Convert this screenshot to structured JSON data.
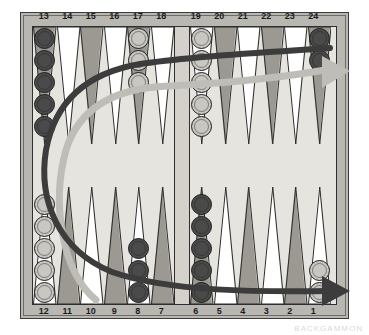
{
  "board": {
    "title": "Backgammon board diagram",
    "point_numbers_top": [
      "13",
      "14",
      "15",
      "16",
      "17",
      "18",
      "19",
      "20",
      "21",
      "22",
      "23",
      "24"
    ],
    "point_numbers_bottom": [
      "12",
      "11",
      "10",
      "9",
      "8",
      "7",
      "6",
      "5",
      "4",
      "3",
      "2",
      "1"
    ],
    "colors": {
      "frame": "#b9b7b1",
      "surface": "#e6e4de",
      "point_dark": "#9b9992",
      "point_light": "#ffffff",
      "checker_dark": "#4a4a4a",
      "checker_light": "#c9c7c1",
      "arrow_dark": "#3c3c3c",
      "arrow_light": "#bfbdb7",
      "outline": "#1d1d1d"
    },
    "points": [
      {
        "number": "13",
        "quadrant": "top-left",
        "index": 0,
        "color": "dark",
        "count": 5
      },
      {
        "number": "14",
        "quadrant": "top-left",
        "index": 1,
        "color": "none",
        "count": 0
      },
      {
        "number": "15",
        "quadrant": "top-left",
        "index": 2,
        "color": "none",
        "count": 0
      },
      {
        "number": "16",
        "quadrant": "top-left",
        "index": 3,
        "color": "none",
        "count": 0
      },
      {
        "number": "17",
        "quadrant": "top-left",
        "index": 4,
        "color": "light",
        "count": 3
      },
      {
        "number": "18",
        "quadrant": "top-left",
        "index": 5,
        "color": "none",
        "count": 0
      },
      {
        "number": "19",
        "quadrant": "top-right",
        "index": 0,
        "color": "light",
        "count": 5
      },
      {
        "number": "20",
        "quadrant": "top-right",
        "index": 1,
        "color": "none",
        "count": 0
      },
      {
        "number": "21",
        "quadrant": "top-right",
        "index": 2,
        "color": "none",
        "count": 0
      },
      {
        "number": "22",
        "quadrant": "top-right",
        "index": 3,
        "color": "none",
        "count": 0
      },
      {
        "number": "23",
        "quadrant": "top-right",
        "index": 4,
        "color": "none",
        "count": 0
      },
      {
        "number": "24",
        "quadrant": "top-right",
        "index": 5,
        "color": "dark",
        "count": 2
      },
      {
        "number": "12",
        "quadrant": "bottom-left",
        "index": 0,
        "color": "light",
        "count": 5
      },
      {
        "number": "11",
        "quadrant": "bottom-left",
        "index": 1,
        "color": "none",
        "count": 0
      },
      {
        "number": "10",
        "quadrant": "bottom-left",
        "index": 2,
        "color": "none",
        "count": 0
      },
      {
        "number": "9",
        "quadrant": "bottom-left",
        "index": 3,
        "color": "none",
        "count": 0
      },
      {
        "number": "8",
        "quadrant": "bottom-left",
        "index": 4,
        "color": "dark",
        "count": 3
      },
      {
        "number": "7",
        "quadrant": "bottom-left",
        "index": 5,
        "color": "none",
        "count": 0
      },
      {
        "number": "6",
        "quadrant": "bottom-right",
        "index": 0,
        "color": "dark",
        "count": 5
      },
      {
        "number": "5",
        "quadrant": "bottom-right",
        "index": 1,
        "color": "none",
        "count": 0
      },
      {
        "number": "4",
        "quadrant": "bottom-right",
        "index": 2,
        "color": "none",
        "count": 0
      },
      {
        "number": "3",
        "quadrant": "bottom-right",
        "index": 3,
        "color": "none",
        "count": 0
      },
      {
        "number": "2",
        "quadrant": "bottom-right",
        "index": 4,
        "color": "none",
        "count": 0
      },
      {
        "number": "1",
        "quadrant": "bottom-right",
        "index": 5,
        "color": "light",
        "count": 2
      }
    ],
    "arrows": [
      {
        "name": "dark-player-direction",
        "color": "#3c3c3c",
        "description": "Dark checkers travel from point 24 anticlockwise around the left side to point 1",
        "from_point": "24",
        "to_point": "1"
      },
      {
        "name": "light-player-direction",
        "color": "#bfbdb7",
        "description": "Light checkers travel from point 1 clockwise around the left side to point 24",
        "from_point": "1",
        "to_point": "24"
      }
    ],
    "ghost_text": [
      {
        "text": "backgammon movement",
        "x": 120,
        "y": 150
      },
      {
        "text": "of the checkers",
        "x": 120,
        "y": 168
      },
      {
        "text": "around the board",
        "x": 118,
        "y": 186
      },
      {
        "text": "direction of play",
        "x": 205,
        "y": 142
      },
      {
        "text": "each player moves",
        "x": 205,
        "y": 160
      },
      {
        "text": "toward home board",
        "x": 203,
        "y": 178
      }
    ],
    "corner_artifact": "BACKGAMMON"
  }
}
